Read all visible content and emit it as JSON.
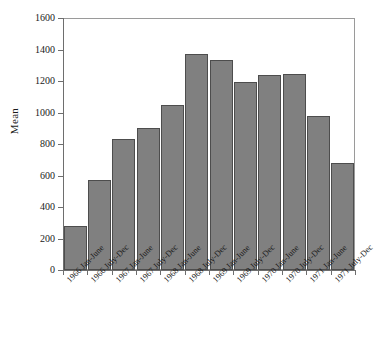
{
  "chart_data": {
    "type": "bar",
    "title": "",
    "xlabel": "",
    "ylabel": "Mean",
    "ylim": [
      0,
      1600
    ],
    "yticks": [
      0,
      200,
      400,
      600,
      800,
      1000,
      1200,
      1400,
      1600
    ],
    "ytick_labels": [
      "0",
      "200",
      "400",
      "600",
      "800",
      "1000",
      "1200",
      "1400",
      "1600"
    ],
    "grid": false,
    "legend": false,
    "bar_color": "#808080",
    "bar_edge_color": "#4d4d4d",
    "frame_color": "#9a9a9a",
    "categories": [
      "1966 Jan-June",
      "1966 July-Dec",
      "1967 Jan-June",
      "1967 July-Dec",
      "1968 Jan-June",
      "1968 July-Dec",
      "1969 Jan-June",
      "1969 July-Dec",
      "1970 Jan-June",
      "1970 July-Dec",
      "1971 Jan-June",
      "1971 July-Dec"
    ],
    "values": [
      279,
      572,
      832,
      902,
      1048,
      1372,
      1334,
      1194,
      1238,
      1242,
      978,
      680
    ]
  }
}
